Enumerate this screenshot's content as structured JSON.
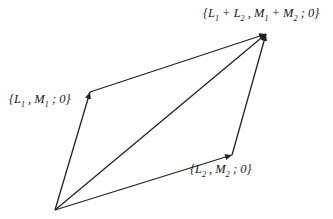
{
  "diagram": {
    "type": "vector-parallelogram",
    "colors": {
      "line": "#222222",
      "text": "#1a1a1a",
      "background": "#ffffff"
    },
    "points": {
      "origin": {
        "x": 55,
        "y": 210
      },
      "v1": {
        "x": 90,
        "y": 92
      },
      "v2": {
        "x": 232,
        "y": 155
      },
      "sum": {
        "x": 266,
        "y": 34
      }
    },
    "labels": {
      "sum": {
        "open": "{",
        "a": "L",
        "a_sub": "1",
        "plus1": " + ",
        "b": "L",
        "b_sub": "2",
        "sep1": " , ",
        "c": "M",
        "c_sub": "1",
        "plus2": " + ",
        "d": "M",
        "d_sub": "2",
        "tail": " ; 0}"
      },
      "v1": {
        "open": "{",
        "a": "L",
        "a_sub": "1",
        "sep": " , ",
        "c": "M",
        "c_sub": "1",
        "tail": " ; 0}"
      },
      "v2": {
        "open": "{",
        "a": "L",
        "a_sub": "2",
        "sep": " , ",
        "c": "M",
        "c_sub": "2",
        "tail": " ; 0}"
      }
    }
  }
}
